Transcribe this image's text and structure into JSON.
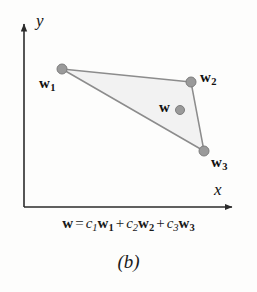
{
  "figure": {
    "caption": "(b)",
    "background_color": "#fdfdfc"
  },
  "axes": {
    "x_label": "x",
    "y_label": "y",
    "axis_color": "#2b2b2b",
    "x_axis": {
      "x1": 24,
      "y1": 207,
      "x2": 238,
      "y2": 207
    },
    "y_axis": {
      "x1": 24,
      "y1": 207,
      "x2": 24,
      "y2": 19
    }
  },
  "diagram": {
    "type": "triangle-convex-combination",
    "fill_color": "#f2f2f2",
    "edge_color": "#8c8c8c",
    "point_color": "#9a9a9a",
    "point_border_color": "#7d7d7d",
    "vertices": [
      {
        "name": "w1",
        "label": "w",
        "subscript": "1",
        "x": 62,
        "y": 69,
        "radius": 5
      },
      {
        "name": "w2",
        "label": "w",
        "subscript": "2",
        "x": 191,
        "y": 82,
        "radius": 5
      },
      {
        "name": "w3",
        "label": "w",
        "subscript": "3",
        "x": 204,
        "y": 151,
        "radius": 5
      }
    ],
    "interior_point": {
      "name": "w",
      "label": "w",
      "subscript": "",
      "x": 180,
      "y": 110,
      "radius": 4.5
    }
  },
  "formula": {
    "lhs": "w",
    "equals": "=",
    "terms": [
      {
        "coefficient": "c",
        "coefficient_sub": "1",
        "vector": "w",
        "vector_sub": "1"
      },
      {
        "coefficient": "c",
        "coefficient_sub": "2",
        "vector": "w",
        "vector_sub": "2"
      },
      {
        "coefficient": "c",
        "coefficient_sub": "3",
        "vector": "w",
        "vector_sub": "3"
      }
    ],
    "plus": "+",
    "text": "w = c1w1 + c2w2 + c3w3"
  },
  "labels": {
    "w1": "w",
    "w1_sub": "1",
    "w2": "w",
    "w2_sub": "2",
    "w3": "w",
    "w3_sub": "3",
    "w": "w"
  }
}
